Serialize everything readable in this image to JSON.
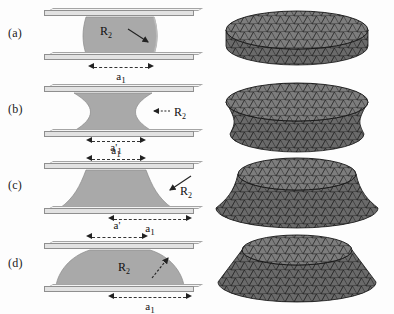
{
  "figure": {
    "caption_panels": [
      "(a)",
      "(b)",
      "(c)",
      "(d)"
    ],
    "background_color": "#fdfdfd",
    "plate_color": "#e2e2e2",
    "plate_edge_color": "#8f8f8f",
    "liquid_color": "#a9a9a9",
    "mesh_color": "#6e6e6e",
    "mesh_wire_color": "#1d1d1d"
  },
  "panels": [
    {
      "id": "a",
      "label": "(a)",
      "shape": "cylindrical-bridge",
      "radius_label": "R",
      "radius_subscript": "2",
      "radius_arrow": "radius-arrow-down-right",
      "dimensions": [
        {
          "name": "a1",
          "base": "a",
          "subscript": "1",
          "prime": "",
          "position": "bottom"
        }
      ],
      "mesh_shape": "flat-cylinder-disc"
    },
    {
      "id": "b",
      "label": "(b)",
      "shape": "concave-neck-bridge",
      "radius_label": "R",
      "radius_subscript": "2",
      "radius_arrow": "meniscus-arrow-left",
      "dimensions": [
        {
          "name": "a1",
          "base": "a",
          "subscript": "1",
          "prime": "",
          "position": "bottom"
        },
        {
          "name": "a1prime",
          "base": "a",
          "subscript": "1",
          "prime": "'",
          "position": "below-outside"
        }
      ],
      "mesh_shape": "waisted-cylinder"
    },
    {
      "id": "c",
      "label": "(c)",
      "shape": "strongly-concave-bridge",
      "radius_label": "R",
      "radius_subscript": "2",
      "radius_arrow": "meniscus-arrow-down-left",
      "dimensions": [
        {
          "name": "a1prime",
          "base": "a",
          "subscript": "1",
          "prime": "'",
          "position": "top"
        },
        {
          "name": "a1",
          "base": "a",
          "subscript": "1",
          "prime": "",
          "position": "bottom"
        }
      ],
      "mesh_shape": "concave-truncated-cone"
    },
    {
      "id": "d",
      "label": "(d)",
      "shape": "convex-dome-bridge",
      "radius_label": "R",
      "radius_subscript": "2",
      "radius_arrow": "radius-arrow-up-right",
      "dimensions": [
        {
          "name": "aprime",
          "base": "a",
          "subscript": "",
          "prime": "'",
          "position": "top"
        },
        {
          "name": "a1",
          "base": "a",
          "subscript": "1",
          "prime": "",
          "position": "bottom"
        }
      ],
      "mesh_shape": "truncated-cone-wide-base"
    }
  ]
}
